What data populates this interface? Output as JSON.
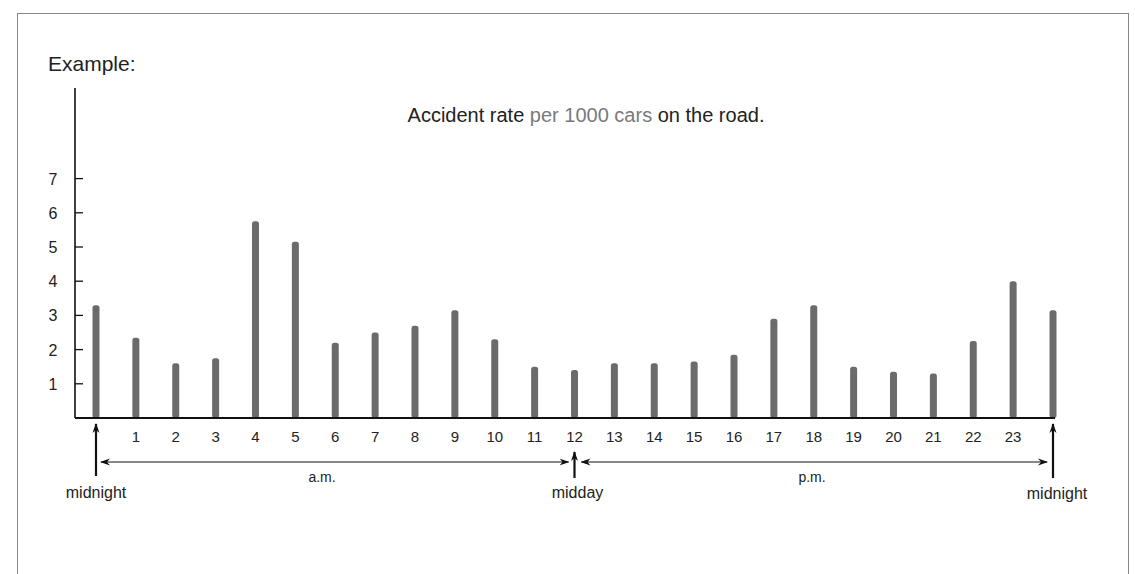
{
  "heading": "Example:",
  "title_parts": [
    {
      "text": "Accident rate ",
      "color": "#222222"
    },
    {
      "text": "per 1000 cars",
      "color": "#7a7a7a"
    },
    {
      "text": " on the road.",
      "color": "#222222"
    }
  ],
  "annotations": {
    "start_marker": "midnight",
    "mid_marker": "midday",
    "end_marker": "midnight",
    "am_label": "a.m.",
    "pm_label": "p.m."
  },
  "colors": {
    "bar": "#6b6b6b",
    "axis": "#111111",
    "frame": "#888888"
  },
  "chart_data": {
    "type": "bar",
    "title": "Accident rate per 1000 cars on the road.",
    "xlabel": "",
    "ylabel": "",
    "categories": [
      "0",
      "1",
      "2",
      "3",
      "4",
      "5",
      "6",
      "7",
      "8",
      "9",
      "10",
      "11",
      "12",
      "13",
      "14",
      "15",
      "16",
      "17",
      "18",
      "19",
      "20",
      "21",
      "22",
      "23",
      "24"
    ],
    "tick_labels": [
      "",
      "1",
      "2",
      "3",
      "4",
      "5",
      "6",
      "7",
      "8",
      "9",
      "10",
      "11",
      "12",
      "13",
      "14",
      "15",
      "16",
      "17",
      "18",
      "19",
      "20",
      "21",
      "22",
      "23",
      ""
    ],
    "values": [
      3.3,
      2.35,
      1.6,
      1.75,
      5.75,
      5.15,
      2.2,
      2.5,
      2.7,
      3.15,
      2.3,
      1.5,
      1.4,
      1.6,
      1.6,
      1.65,
      1.85,
      2.9,
      3.3,
      1.5,
      1.35,
      1.3,
      2.25,
      4.0,
      3.15
    ],
    "yticks": [
      1,
      2,
      3,
      4,
      5,
      6,
      7
    ],
    "ylim": [
      0,
      7.5
    ],
    "grid": false,
    "legend": null,
    "annotations": [
      "midnight",
      "a.m.",
      "midday",
      "p.m.",
      "midnight"
    ]
  }
}
